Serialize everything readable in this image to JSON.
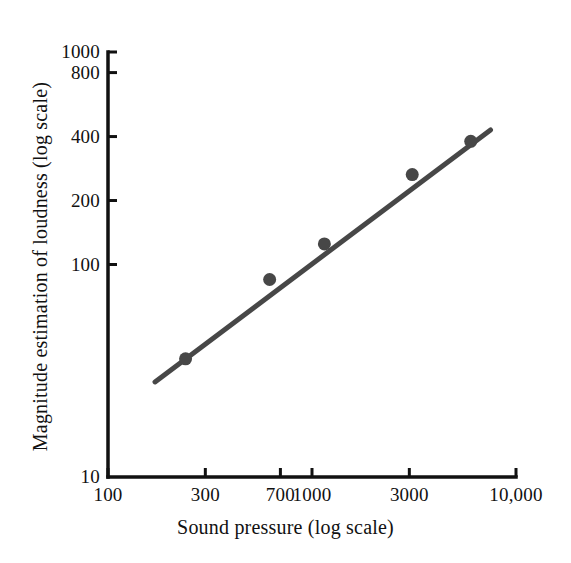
{
  "chart_data": {
    "type": "scatter",
    "title": "",
    "xlabel": "Sound pressure (log scale)",
    "ylabel": "Magnitude estimation of loudness (log scale)",
    "xscale": "log",
    "yscale": "log",
    "xlim": [
      100,
      10000
    ],
    "ylim": [
      10,
      1000
    ],
    "grid": false,
    "legend": null,
    "xticks": [
      {
        "value": 100,
        "label": "100"
      },
      {
        "value": 300,
        "label": "300"
      },
      {
        "value": 700,
        "label": "700"
      },
      {
        "value": 1000,
        "label": "1000"
      },
      {
        "value": 3000,
        "label": "3000"
      },
      {
        "value": 10000,
        "label": "10,000"
      }
    ],
    "yticks": [
      {
        "value": 10,
        "label": "10"
      },
      {
        "value": 100,
        "label": "100"
      },
      {
        "value": 200,
        "label": "200"
      },
      {
        "value": 400,
        "label": "400"
      },
      {
        "value": 800,
        "label": "800"
      },
      {
        "value": 1000,
        "label": "1000"
      }
    ],
    "series": [
      {
        "name": "Magnitude estimation of loudness",
        "marker": "filled-circle",
        "color": "#474747",
        "points": [
          {
            "x": 240,
            "y": 36
          },
          {
            "x": 620,
            "y": 85
          },
          {
            "x": 1150,
            "y": 125
          },
          {
            "x": 3100,
            "y": 265
          },
          {
            "x": 6000,
            "y": 380
          }
        ]
      }
    ],
    "fit_line": {
      "name": "power-function fit",
      "color": "#474747",
      "start": {
        "x": 170,
        "y": 28
      },
      "end": {
        "x": 7500,
        "y": 430
      }
    }
  },
  "style": {
    "axis_color": "#111111",
    "data_color": "#474747",
    "background": "#ffffff"
  }
}
